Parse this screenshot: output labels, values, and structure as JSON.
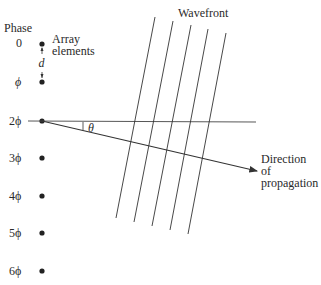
{
  "diagram": {
    "labels": {
      "phase_header": "Phase",
      "array_elements_line1": "Array",
      "array_elements_line2": "elements",
      "spacing": "d",
      "wavefront": "Wavefront",
      "angle": "θ",
      "direction_line1": "Direction",
      "direction_line2": "of",
      "direction_line3": "propagation"
    },
    "phases": [
      "0",
      "ϕ",
      "2ϕ",
      "3ϕ",
      "4ϕ",
      "5ϕ",
      "6ϕ"
    ],
    "elements": [
      {
        "x": 42,
        "y": 44
      },
      {
        "x": 42,
        "y": 82
      },
      {
        "x": 42,
        "y": 121
      },
      {
        "x": 42,
        "y": 158
      },
      {
        "x": 42,
        "y": 196
      },
      {
        "x": 42,
        "y": 233
      },
      {
        "x": 42,
        "y": 271
      }
    ],
    "wavefront_lines": [
      {
        "x1": 155,
        "y1": 17,
        "x2": 116,
        "y2": 218
      },
      {
        "x1": 173,
        "y1": 21,
        "x2": 134,
        "y2": 222
      },
      {
        "x1": 191,
        "y1": 25,
        "x2": 152,
        "y2": 226
      },
      {
        "x1": 208,
        "y1": 29,
        "x2": 170,
        "y2": 230
      },
      {
        "x1": 226,
        "y1": 33,
        "x2": 188,
        "y2": 234
      }
    ],
    "colors": {
      "line": "#333333",
      "text": "#2a2a2a",
      "background": "#ffffff"
    }
  }
}
